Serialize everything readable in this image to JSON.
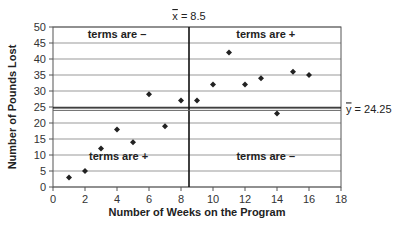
{
  "chart_data": {
    "type": "scatter",
    "title": "",
    "xlabel": "Number of Weeks on the Program",
    "ylabel": "Number of Pounds Lost",
    "xlim": [
      0,
      18
    ],
    "ylim": [
      0,
      50
    ],
    "xticks": [
      0,
      2,
      4,
      6,
      8,
      10,
      12,
      14,
      16,
      18
    ],
    "yticks": [
      0,
      5,
      10,
      15,
      20,
      25,
      30,
      35,
      40,
      45,
      50
    ],
    "grid": "horizontal",
    "legend": "none",
    "series": [
      {
        "name": "Pounds Lost",
        "x": [
          1,
          2,
          3,
          4,
          5,
          6,
          7,
          8,
          9,
          10,
          11,
          12,
          13,
          14,
          15,
          16
        ],
        "y": [
          3,
          5,
          12,
          18,
          14,
          29,
          19,
          27,
          27,
          32,
          42,
          32,
          34,
          23,
          36,
          35
        ]
      }
    ],
    "reference_lines": [
      {
        "axis": "x",
        "value": 8.5,
        "label_var": "x",
        "label_eq": "= 8.5"
      },
      {
        "axis": "y",
        "value": 24.25,
        "label_var": "y",
        "label_eq": "= 24.25"
      }
    ],
    "annotations": [
      {
        "text": "terms are –",
        "quadrant": "top-left"
      },
      {
        "text": "terms are +",
        "quadrant": "top-right"
      },
      {
        "text": "terms are +",
        "quadrant": "bottom-left"
      },
      {
        "text": "terms are –",
        "quadrant": "bottom-right"
      }
    ]
  }
}
